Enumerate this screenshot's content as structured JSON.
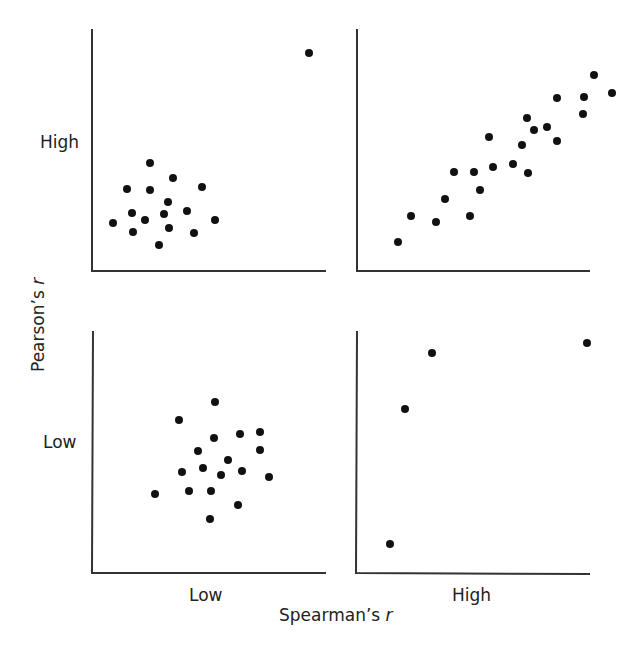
{
  "chart_data": [
    {
      "type": "scatter",
      "panel": "top-left",
      "title": "",
      "row": "High Pearson's r",
      "column": "Low Spearman's r",
      "description": "Cluster of points with one extreme outlier at upper right",
      "points": [
        [
          309,
          53
        ],
        [
          150,
          163
        ],
        [
          173,
          178
        ],
        [
          127,
          189
        ],
        [
          150,
          190
        ],
        [
          202,
          187
        ],
        [
          168,
          202
        ],
        [
          132,
          213
        ],
        [
          164,
          214
        ],
        [
          187,
          211
        ],
        [
          113,
          223
        ],
        [
          145,
          220
        ],
        [
          215,
          220
        ],
        [
          133,
          232
        ],
        [
          169,
          228
        ],
        [
          194,
          233
        ],
        [
          159,
          245
        ]
      ]
    },
    {
      "type": "scatter",
      "panel": "top-right",
      "title": "",
      "row": "High Pearson's r",
      "column": "High Spearman's r",
      "description": "Strong positive linear trend",
      "points": [
        [
          594,
          75
        ],
        [
          612,
          93
        ],
        [
          557,
          98
        ],
        [
          584,
          97
        ],
        [
          583,
          114
        ],
        [
          527,
          118
        ],
        [
          534,
          130
        ],
        [
          547,
          127
        ],
        [
          489,
          137
        ],
        [
          557,
          141
        ],
        [
          522,
          145
        ],
        [
          454,
          172
        ],
        [
          474,
          172
        ],
        [
          493,
          167
        ],
        [
          513,
          164
        ],
        [
          528,
          173
        ],
        [
          480,
          190
        ],
        [
          445,
          199
        ],
        [
          411,
          216
        ],
        [
          436,
          222
        ],
        [
          470,
          216
        ],
        [
          398,
          242
        ]
      ]
    },
    {
      "type": "scatter",
      "panel": "bottom-left",
      "title": "",
      "row": "Low Pearson's r",
      "column": "Low Spearman's r",
      "description": "Uncorrelated cloud of points",
      "points": [
        [
          215,
          402
        ],
        [
          179,
          420
        ],
        [
          214,
          438
        ],
        [
          240,
          434
        ],
        [
          260,
          432
        ],
        [
          198,
          451
        ],
        [
          260,
          450
        ],
        [
          228,
          460
        ],
        [
          182,
          472
        ],
        [
          203,
          468
        ],
        [
          221,
          475
        ],
        [
          242,
          471
        ],
        [
          269,
          477
        ],
        [
          155,
          494
        ],
        [
          189,
          491
        ],
        [
          211,
          491
        ],
        [
          238,
          505
        ],
        [
          210,
          519
        ]
      ]
    },
    {
      "type": "scatter",
      "panel": "bottom-right",
      "title": "",
      "row": "Low Pearson's r",
      "column": "High Spearman's r",
      "description": "Few points, monotonic but non-linear",
      "points": [
        [
          390,
          544
        ],
        [
          405,
          409
        ],
        [
          432,
          353
        ],
        [
          587,
          343
        ]
      ]
    }
  ],
  "labels": {
    "y_axis_title": "Pearson’s",
    "y_axis_title_var": "r",
    "x_axis_title": "Spearman’s",
    "x_axis_title_var": "r",
    "row_high": "High",
    "row_low": "Low",
    "col_low": "Low",
    "col_high": "High"
  },
  "style": {
    "axis_color": "#333333",
    "point_color": "#111111",
    "point_radius": 4
  }
}
